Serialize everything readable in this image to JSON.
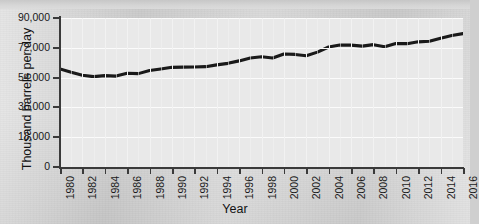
{
  "figure": {
    "background_color": "#d2d2d2",
    "plot_background_color": "#e9e9e9",
    "line_color": "#1a1a1a",
    "grid_color": "#fbfbfb",
    "cropped_title_text": ""
  },
  "chart_data": {
    "type": "line",
    "title": "",
    "xlabel": "Year",
    "ylabel": "Thousand barrels per day",
    "xlim": [
      1980,
      2016
    ],
    "ylim": [
      0,
      90000
    ],
    "grid": true,
    "legend": "none",
    "ytick_labels": [
      "0",
      "18,000",
      "36,000",
      "54,000",
      "72,000",
      "90,000"
    ],
    "ytick_values": [
      0,
      18000,
      36000,
      54000,
      72000,
      90000
    ],
    "xtick_labels": [
      "1980",
      "1982",
      "1984",
      "1986",
      "1988",
      "1990",
      "1992",
      "1994",
      "1996",
      "1998",
      "2000",
      "2002",
      "2004",
      "2006",
      "2008",
      "2010",
      "2012",
      "2014",
      "2016"
    ],
    "xtick_values": [
      1980,
      1982,
      1984,
      1986,
      1988,
      1990,
      1992,
      1994,
      1996,
      1998,
      2000,
      2002,
      2004,
      2006,
      2008,
      2010,
      2012,
      2014,
      2016
    ],
    "series": [
      {
        "name": "World oil production",
        "x": [
          1980,
          1981,
          1982,
          1983,
          1984,
          1985,
          1986,
          1987,
          1988,
          1989,
          1990,
          1991,
          1992,
          1993,
          1994,
          1995,
          1996,
          1997,
          1998,
          1999,
          2000,
          2001,
          2002,
          2003,
          2004,
          2005,
          2006,
          2007,
          2008,
          2009,
          2010,
          2011,
          2012,
          2013,
          2014,
          2015,
          2016
        ],
        "values": [
          59200,
          57200,
          55400,
          54600,
          55200,
          54900,
          56600,
          56400,
          58300,
          59200,
          60200,
          60300,
          60400,
          60600,
          61700,
          62600,
          64100,
          65800,
          66600,
          65800,
          68300,
          68000,
          67200,
          69400,
          72500,
          73700,
          73600,
          73000,
          73900,
          72600,
          74600,
          74500,
          75600,
          76000,
          77800,
          79400,
          80600
        ]
      }
    ]
  }
}
